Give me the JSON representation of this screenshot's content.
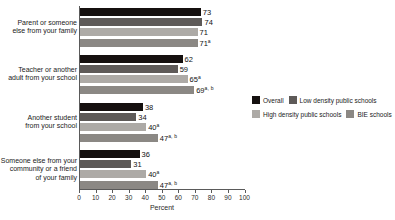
{
  "chart_data": {
    "type": "bar",
    "orientation": "horizontal",
    "title": "",
    "xlabel": "Percent",
    "ylabel": "",
    "xlim": [
      0,
      100
    ],
    "xticks": [
      "0",
      "10",
      "20",
      "30",
      "40",
      "50",
      "60",
      "70",
      "80",
      "90",
      "100"
    ],
    "grid": false,
    "legend_position": "right",
    "categories": [
      "Parent or someone else from your family",
      "Teacher or another adult from your school",
      "Another student from your school",
      "Someone else from your community or a friend of your family"
    ],
    "category_lines": [
      [
        "Parent or someone",
        "else from your family"
      ],
      [
        "Teacher or another",
        "adult from your school"
      ],
      [
        "Another student",
        "from your school"
      ],
      [
        "Someone else from your",
        "community or a friend",
        "of your family"
      ]
    ],
    "series": [
      {
        "name": "Overall",
        "color": "#15100f",
        "values": [
          73,
          62,
          38,
          36
        ],
        "labels": [
          "73",
          "62",
          "38",
          "36"
        ],
        "notes": [
          "",
          "",
          "",
          ""
        ]
      },
      {
        "name": "Low density public schools",
        "color": "#5e5a58",
        "values": [
          74,
          59,
          34,
          31
        ],
        "labels": [
          "74",
          "59",
          "34",
          "31"
        ],
        "notes": [
          "",
          "",
          "",
          ""
        ]
      },
      {
        "name": "High density public schools",
        "color": "#adaaa6",
        "values": [
          71,
          65,
          40,
          40
        ],
        "labels": [
          "71",
          "65",
          "40",
          "40"
        ],
        "notes": [
          "",
          "a",
          "a",
          "a"
        ]
      },
      {
        "name": "BIE schools",
        "color": "#8b8884",
        "values": [
          71,
          69,
          47,
          47
        ],
        "labels": [
          "71",
          "69",
          "47",
          "47"
        ],
        "notes": [
          "a",
          "a, b",
          "a, b",
          "a, b"
        ]
      }
    ]
  }
}
